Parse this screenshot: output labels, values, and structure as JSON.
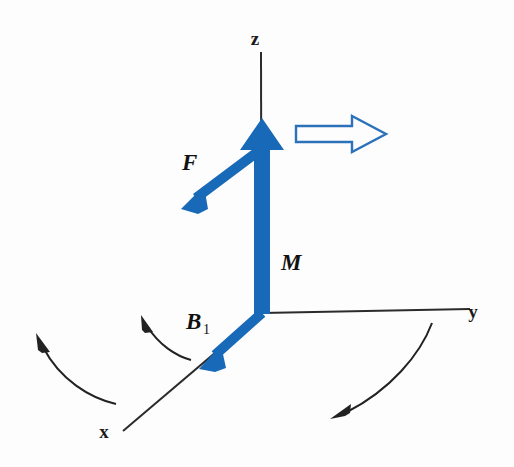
{
  "figure": {
    "background_color": "#fdfdfd",
    "width": 514,
    "height": 467,
    "vector_color": "#1869b8",
    "axis_color": "#2b2b2b"
  },
  "axes": {
    "z": {
      "label": "z",
      "label_x": 255,
      "label_y": 45
    },
    "y": {
      "label": "y",
      "label_x": 473,
      "label_y": 318
    },
    "x": {
      "label": "x",
      "label_x": 104,
      "label_y": 438
    }
  },
  "vectors": [
    {
      "name": "M",
      "label": "M",
      "subscript": "",
      "label_x": 281,
      "label_y": 270,
      "color": "#1869b8",
      "description": "magnetization vector along +z"
    },
    {
      "name": "F",
      "label": "F",
      "subscript": "",
      "label_x": 182,
      "label_y": 170,
      "color": "#1869b8",
      "description": "force vector pointing down-left"
    },
    {
      "name": "B1",
      "label": "B",
      "subscript": "1",
      "label_x": 186,
      "label_y": 329,
      "color": "#1869b8",
      "description": "radiofrequency field vector along -x"
    }
  ],
  "outline_arrow": {
    "name": "precession-direction-arrow",
    "color": "#1869b8",
    "description": "hollow outline arrow pointing right, near top of z axis"
  },
  "curved_arrows": [
    {
      "name": "curved-arrow-lower-left-outer",
      "direction": "counterclockwise, pointing up-left"
    },
    {
      "name": "curved-arrow-near-b1",
      "direction": "counterclockwise, pointing up-left"
    },
    {
      "name": "curved-arrow-lower-right",
      "direction": "pointing down-left"
    }
  ]
}
